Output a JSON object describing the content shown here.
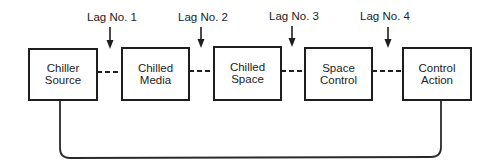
{
  "diagram": {
    "type": "block-diagram",
    "boxes": [
      {
        "id": "chiller-source",
        "line1": "Chiller",
        "line2": "Source"
      },
      {
        "id": "chilled-media",
        "line1": "Chilled",
        "line2": "Media"
      },
      {
        "id": "chilled-space",
        "line1": "Chilled",
        "line2": "Space"
      },
      {
        "id": "space-control",
        "line1": "Space",
        "line2": "Control"
      },
      {
        "id": "control-action",
        "line1": "Control",
        "line2": "Action"
      }
    ],
    "lags": [
      {
        "label": "Lag No. 1",
        "between": [
          "Chiller Source",
          "Chilled Media"
        ]
      },
      {
        "label": "Lag No. 2",
        "between": [
          "Chilled Media",
          "Chilled Space"
        ]
      },
      {
        "label": "Lag No. 3",
        "between": [
          "Chilled Space",
          "Space Control"
        ]
      },
      {
        "label": "Lag No. 4",
        "between": [
          "Space Control",
          "Control Action"
        ]
      }
    ],
    "links": {
      "style": "dashed",
      "feedback": {
        "from": "Control Action",
        "to": "Chiller Source",
        "style": "solid"
      }
    },
    "colors": {
      "line": "#1e1e1e",
      "text": "#222222",
      "background": "#ffffff"
    }
  }
}
